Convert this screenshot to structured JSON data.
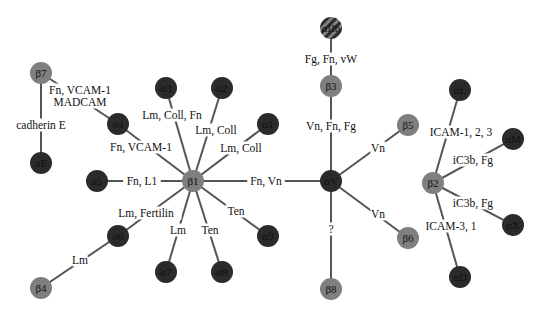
{
  "diagram": {
    "colors": {
      "beta_subunit": "#7f7f7f",
      "alpha_subunit": "#2b2b2b",
      "edge": "#555555",
      "background": "#ffffff"
    },
    "nodes": [
      {
        "id": "b7",
        "label": "β7",
        "type": "beta",
        "x": 41,
        "y": 73
      },
      {
        "id": "a4",
        "label": "α4",
        "type": "alpha",
        "x": 118,
        "y": 124
      },
      {
        "id": "aE",
        "label": "αE",
        "type": "alpha",
        "x": 41,
        "y": 163
      },
      {
        "id": "a3",
        "label": "α3",
        "type": "alpha",
        "x": 166,
        "y": 88
      },
      {
        "id": "a2",
        "label": "α2",
        "type": "alpha",
        "x": 222,
        "y": 88
      },
      {
        "id": "a1",
        "label": "α1",
        "type": "alpha",
        "x": 268,
        "y": 124
      },
      {
        "id": "a5",
        "label": "α5",
        "type": "alpha",
        "x": 97,
        "y": 181
      },
      {
        "id": "b1",
        "label": "β1",
        "type": "beta",
        "x": 193,
        "y": 181
      },
      {
        "id": "a6",
        "label": "α6",
        "type": "alpha",
        "x": 118,
        "y": 236
      },
      {
        "id": "b4",
        "label": "β4",
        "type": "beta",
        "x": 41,
        "y": 288
      },
      {
        "id": "a7",
        "label": "α7",
        "type": "alpha",
        "x": 166,
        "y": 272
      },
      {
        "id": "a8",
        "label": "α8",
        "type": "alpha",
        "x": 222,
        "y": 272
      },
      {
        "id": "a9",
        "label": "α9",
        "type": "alpha",
        "x": 268,
        "y": 236
      },
      {
        "id": "aIIb",
        "label": "αIIb",
        "type": "hatched",
        "x": 331,
        "y": 28
      },
      {
        "id": "b3",
        "label": "β3",
        "type": "beta",
        "x": 331,
        "y": 86
      },
      {
        "id": "aV",
        "label": "αV",
        "type": "alpha",
        "x": 331,
        "y": 181
      },
      {
        "id": "b5",
        "label": "β5",
        "type": "beta",
        "x": 408,
        "y": 125
      },
      {
        "id": "b6",
        "label": "β6",
        "type": "beta",
        "x": 408,
        "y": 238
      },
      {
        "id": "b8",
        "label": "β8",
        "type": "beta",
        "x": 331,
        "y": 289
      },
      {
        "id": "aL",
        "label": "αL",
        "type": "alpha",
        "x": 460,
        "y": 90
      },
      {
        "id": "aM",
        "label": "αM",
        "type": "alpha",
        "x": 513,
        "y": 139
      },
      {
        "id": "b2",
        "label": "β2",
        "type": "beta",
        "x": 433,
        "y": 183
      },
      {
        "id": "aX",
        "label": "αX",
        "type": "alpha",
        "x": 513,
        "y": 225
      },
      {
        "id": "aD",
        "label": "αD",
        "type": "alpha",
        "x": 460,
        "y": 277
      }
    ],
    "edges": [
      {
        "from": "b7",
        "to": "a4",
        "label": "Fn, VCAM-1",
        "label2": "MADCAM",
        "lx": 80,
        "ly": 90
      },
      {
        "from": "b7",
        "to": "aE",
        "label": "cadherin E",
        "lx": 41,
        "ly": 125
      },
      {
        "from": "b1",
        "to": "a4",
        "label": "Fn, VCAM-1",
        "lx": 141,
        "ly": 147
      },
      {
        "from": "b1",
        "to": "a3",
        "label": "Lm, Coll, Fn",
        "lx": 172,
        "ly": 115
      },
      {
        "from": "b1",
        "to": "a2",
        "label": "Lm, Coll",
        "lx": 216,
        "ly": 130
      },
      {
        "from": "b1",
        "to": "a1",
        "label": "Lm, Coll",
        "lx": 241,
        "ly": 148
      },
      {
        "from": "b1",
        "to": "a5",
        "label": "Fn, L1",
        "lx": 142,
        "ly": 181
      },
      {
        "from": "b1",
        "to": "a6",
        "label": "Lm, Fertilin",
        "lx": 146,
        "ly": 213
      },
      {
        "from": "b4",
        "to": "a6",
        "label": "Lm",
        "lx": 80,
        "ly": 260
      },
      {
        "from": "b1",
        "to": "a7",
        "label": "Lm",
        "lx": 178,
        "ly": 230
      },
      {
        "from": "b1",
        "to": "a8",
        "label": "Ten",
        "lx": 210,
        "ly": 230
      },
      {
        "from": "b1",
        "to": "a9",
        "label": "Ten",
        "lx": 236,
        "ly": 211
      },
      {
        "from": "b1",
        "to": "aV",
        "label": "Fn, Vn",
        "lx": 266,
        "ly": 181
      },
      {
        "from": "aIIb",
        "to": "b3",
        "label": "Fg, Fn, vW",
        "lx": 331,
        "ly": 59
      },
      {
        "from": "b3",
        "to": "aV",
        "label": "Vn, Fn, Fg",
        "lx": 331,
        "ly": 126
      },
      {
        "from": "aV",
        "to": "b5",
        "label": "Vn",
        "lx": 378,
        "ly": 148
      },
      {
        "from": "aV",
        "to": "b6",
        "label": "Vn",
        "lx": 378,
        "ly": 214
      },
      {
        "from": "aV",
        "to": "b8",
        "label": "?",
        "lx": 331,
        "ly": 229
      },
      {
        "from": "b2",
        "to": "aL",
        "label": "ICAM-1, 2, 3",
        "lx": 461,
        "ly": 132
      },
      {
        "from": "b2",
        "to": "aM",
        "label": "iC3b, Fg",
        "lx": 473,
        "ly": 160
      },
      {
        "from": "b2",
        "to": "aX",
        "label": "iC3b, Fg",
        "lx": 473,
        "ly": 203
      },
      {
        "from": "b2",
        "to": "aD",
        "label": "ICAM-3, 1",
        "lx": 451,
        "ly": 226
      }
    ]
  }
}
